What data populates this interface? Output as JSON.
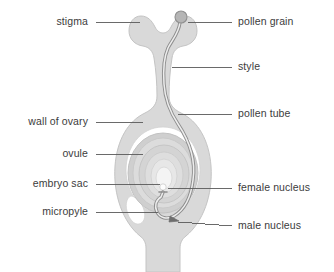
{
  "diagram": {
    "type": "biology-labelled-diagram",
    "colors": {
      "tissue_fill": "#d9d9d9",
      "tissue_stroke": "#c2c2c2",
      "cavity_fill": "#ffffff",
      "integument_outer": "#cfcfcf",
      "integument_mid": "#dcdcdc",
      "integument_inner": "#e6e6e6",
      "embryo_sac_fill": "#f2f2f2",
      "nucleus_fill": "#fbfbfb",
      "pollen_grain_fill": "#b5b5b5",
      "pollen_tube_stroke": "#8c8c8c",
      "leader_line": "#5a5a5a",
      "label_text": "#3c3c3c",
      "background": "#ffffff"
    },
    "labels": {
      "left": [
        {
          "id": "stigma",
          "text": "stigma",
          "x": 88,
          "y": 18,
          "line_from": 96,
          "line_to": 140,
          "line_y": 22
        },
        {
          "id": "wall-of-ovary",
          "text": "wall of ovary",
          "x": 88,
          "y": 118,
          "line_from": 96,
          "line_to": 143,
          "line_y": 122
        },
        {
          "id": "ovule",
          "text": "ovule",
          "x": 88,
          "y": 150,
          "line_from": 96,
          "line_to": 143,
          "line_y": 154
        },
        {
          "id": "embryo-sac",
          "text": "embryo sac",
          "x": 88,
          "y": 180,
          "line_from": 96,
          "line_to": 160,
          "line_y": 184
        },
        {
          "id": "micropyle",
          "text": "micropyle",
          "x": 88,
          "y": 208,
          "line_from": 96,
          "line_to": 158,
          "line_y": 212
        }
      ],
      "right": [
        {
          "id": "pollen-grain",
          "text": "pollen grain",
          "x": 238,
          "y": 18,
          "line_from": 188,
          "line_to": 232,
          "line_y": 22
        },
        {
          "id": "style",
          "text": "style",
          "x": 238,
          "y": 63,
          "line_from": 172,
          "line_to": 232,
          "line_y": 67
        },
        {
          "id": "pollen-tube",
          "text": "pollen tube",
          "x": 238,
          "y": 110,
          "line_from": 178,
          "line_to": 232,
          "line_y": 114
        },
        {
          "id": "female-nucleus",
          "text": "female nucleus",
          "x": 238,
          "y": 184,
          "line_from": 170,
          "line_to": 232,
          "line_y": 188
        },
        {
          "id": "male-nucleus",
          "text": "male nucleus",
          "x": 238,
          "y": 222,
          "line_from": 176,
          "line_to": 232,
          "line_y": 226
        }
      ]
    },
    "structures": [
      {
        "id": "stigma",
        "name": "stigma"
      },
      {
        "id": "style",
        "name": "style"
      },
      {
        "id": "ovary-wall",
        "name": "wall of ovary"
      },
      {
        "id": "ovule",
        "name": "ovule"
      },
      {
        "id": "embryo-sac",
        "name": "embryo sac"
      },
      {
        "id": "micropyle",
        "name": "micropyle"
      },
      {
        "id": "pollen-grain",
        "name": "pollen grain"
      },
      {
        "id": "pollen-tube",
        "name": "pollen tube"
      },
      {
        "id": "female-nucleus",
        "name": "female nucleus"
      },
      {
        "id": "male-nucleus",
        "name": "male nucleus"
      }
    ]
  }
}
